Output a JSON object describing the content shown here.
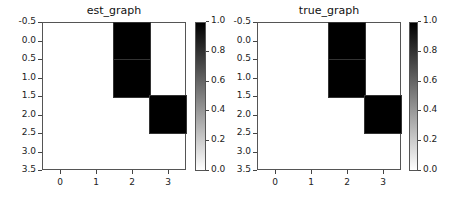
{
  "chart_data": [
    {
      "type": "heatmap",
      "title": "est_graph",
      "xlabel": "",
      "ylabel": "",
      "x_ticks": [
        "0",
        "1",
        "2",
        "3"
      ],
      "y_ticks": [
        "-0.5",
        "0.0",
        "0.5",
        "1.0",
        "1.5",
        "2.0",
        "2.5",
        "3.0",
        "3.5"
      ],
      "xlim": [
        -0.5,
        3.5
      ],
      "ylim": [
        3.5,
        -0.5
      ],
      "matrix": [
        [
          0,
          0,
          1,
          0
        ],
        [
          0,
          0,
          1,
          0
        ],
        [
          0,
          0,
          0,
          1
        ],
        [
          0,
          0,
          0,
          0
        ]
      ],
      "colormap": "Greys",
      "colorbar": {
        "range": [
          0.0,
          1.0
        ],
        "ticks": [
          "0.0",
          "0.2",
          "0.4",
          "0.6",
          "0.8",
          "1.0"
        ]
      },
      "grid": false
    },
    {
      "type": "heatmap",
      "title": "true_graph",
      "xlabel": "",
      "ylabel": "",
      "x_ticks": [
        "0",
        "1",
        "2",
        "3"
      ],
      "y_ticks": [
        "-0.5",
        "0.0",
        "0.5",
        "1.0",
        "1.5",
        "2.0",
        "2.5",
        "3.0",
        "3.5"
      ],
      "xlim": [
        -0.5,
        3.5
      ],
      "ylim": [
        3.5,
        -0.5
      ],
      "matrix": [
        [
          0,
          0,
          1,
          0
        ],
        [
          0,
          0,
          1,
          0
        ],
        [
          0,
          0,
          0,
          1
        ],
        [
          0,
          0,
          0,
          0
        ]
      ],
      "colormap": "Greys",
      "colorbar": {
        "range": [
          0.0,
          1.0
        ],
        "ticks": [
          "0.0",
          "0.2",
          "0.4",
          "0.6",
          "0.8",
          "1.0"
        ]
      },
      "grid": false
    }
  ],
  "colors": {
    "on": "#000000",
    "off": "#ffffff",
    "axis": "#555555"
  }
}
